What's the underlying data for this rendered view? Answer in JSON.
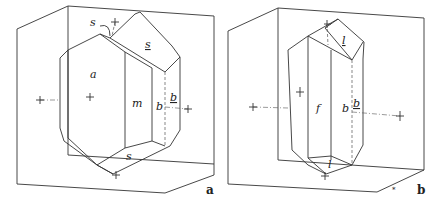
{
  "figures": [
    {
      "id": "a",
      "caption": "a",
      "faces": {
        "a": "a",
        "m": "m",
        "b": "b",
        "b_under": "b",
        "s_top": "s",
        "s_top_under": "s",
        "s_bottom": "s"
      }
    },
    {
      "id": "b",
      "caption": "b",
      "faces": {
        "f": "f",
        "b": "b",
        "b_under": "b",
        "l_top_under": "l",
        "l_bottom": "l"
      },
      "small_mark": "*"
    }
  ]
}
